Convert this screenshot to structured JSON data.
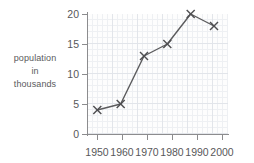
{
  "chart_data": {
    "type": "line",
    "title": "",
    "xlabel": "",
    "ylabel": "population in thousands",
    "ylabel_lines": [
      "population",
      "in",
      "thousands"
    ],
    "categories": [
      1950,
      1960,
      1970,
      1980,
      1990,
      2000
    ],
    "x": [
      1950,
      1960,
      1970,
      1980,
      1990,
      2000
    ],
    "values": [
      4,
      5,
      13,
      15,
      20,
      18
    ],
    "series": [
      {
        "name": "population in thousands",
        "values": [
          4,
          5,
          13,
          15,
          20,
          18
        ]
      }
    ],
    "xtick_labels": [
      "1950",
      "1960",
      "1970",
      "1980",
      "1990",
      "2000"
    ],
    "ytick_labels": [
      "0",
      "5",
      "10",
      "15",
      "20"
    ],
    "yticks": [
      0,
      5,
      10,
      15,
      20
    ],
    "ylim": [
      0,
      20
    ],
    "xlim": [
      1950,
      2000
    ],
    "grid": true,
    "legend": false,
    "marker": "x",
    "line_color": "#5b5b5d",
    "grid_color": "#e2e5ea",
    "axis_color": "#8c8c8e",
    "text_color": "#58585a",
    "background": "#ffffff"
  }
}
